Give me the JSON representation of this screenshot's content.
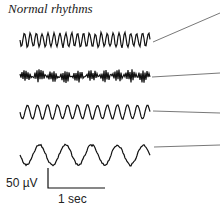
{
  "figure": {
    "title": "Normal rhythms",
    "traces": [
      {
        "name": "trace-1",
        "y": 40,
        "amp": 7,
        "freq": 22,
        "noise": 2
      },
      {
        "name": "trace-2",
        "y": 76,
        "amp": 5,
        "freq": 60,
        "noise": 4
      },
      {
        "name": "trace-3",
        "y": 112,
        "amp": 7,
        "freq": 13,
        "noise": 1
      },
      {
        "name": "trace-4",
        "y": 155,
        "amp": 10,
        "freq": 5,
        "noise": 2
      }
    ],
    "scale_bar": {
      "voltage_label": "50 µV",
      "time_label": "1 sec"
    }
  }
}
